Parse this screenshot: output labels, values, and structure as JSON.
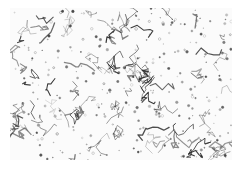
{
  "image": {
    "subject": "grayscale micrograph of grain boundary network",
    "background_color": "#ffffff",
    "texture_color": "#2a2a2a",
    "region": {
      "x": 10,
      "y": 8,
      "width": 222,
      "height": 152
    }
  }
}
